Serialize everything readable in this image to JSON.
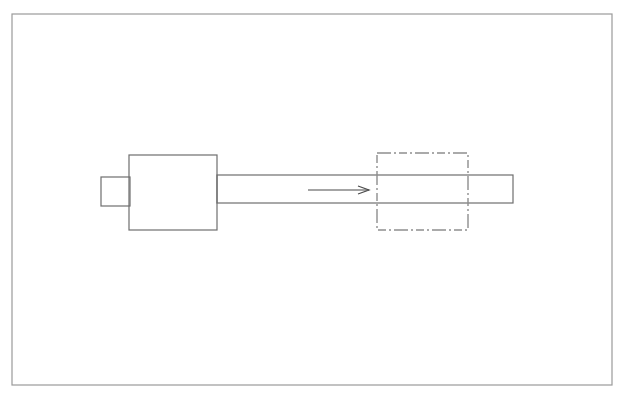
{
  "document": {
    "title": "Mechanical Part Displacement Diagram",
    "background_color": "#ffffff",
    "width": 628,
    "height": 406
  },
  "frame": {
    "name": "drawing-border",
    "x": 12,
    "y": 14,
    "width": 600,
    "height": 371,
    "stroke_color": "#9a9a9a",
    "stroke_width": 1.2,
    "fill": "none"
  },
  "line_styles": {
    "solid_stroke": "#6e6e6e",
    "solid_width": 1.2,
    "phantom_stroke": "#8e8e8e",
    "phantom_width": 1.4,
    "phantom_dash": "14,3,2,3,8,3,2,3",
    "arrow_stroke": "#4a4a4a",
    "arrow_width": 1.2
  },
  "shapes": [
    {
      "name": "left-end-tab",
      "type": "rect",
      "x": 101,
      "y": 177,
      "width": 29,
      "height": 29,
      "style": "solid",
      "description": "small square tab at the far left end of the shaft"
    },
    {
      "name": "collar-block",
      "type": "rect",
      "x": 129,
      "y": 155,
      "width": 88,
      "height": 75,
      "style": "solid",
      "description": "large rectangular collar or flange block"
    },
    {
      "name": "shaft-body",
      "type": "rect",
      "x": 217,
      "y": 175,
      "width": 296,
      "height": 28,
      "style": "solid",
      "description": "long horizontal shaft extending to the right"
    },
    {
      "name": "phantom-position-outline",
      "type": "rect",
      "x": 377,
      "y": 153,
      "width": 91,
      "height": 77,
      "style": "phantom",
      "description": "dash-dot chain line rectangle marking the alternate or final position of the collar block"
    }
  ],
  "annotations": [
    {
      "name": "motion-direction-arrow",
      "type": "arrow",
      "x1": 308,
      "y1": 190,
      "x2": 369,
      "y2": 190,
      "head_length": 11,
      "head_half_width": 4,
      "description": "arrow pointing right indicating direction of travel from collar block to phantom position"
    }
  ],
  "labels": []
}
